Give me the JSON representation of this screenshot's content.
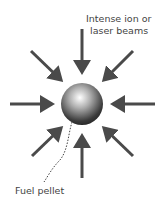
{
  "diagram": {
    "labels": {
      "beams_line1": "Intense ion or",
      "beams_line2": "laser beams",
      "pellet": "Fuel pellet"
    },
    "colors": {
      "arrow": "#4a4a4a",
      "text": "#444444"
    }
  }
}
